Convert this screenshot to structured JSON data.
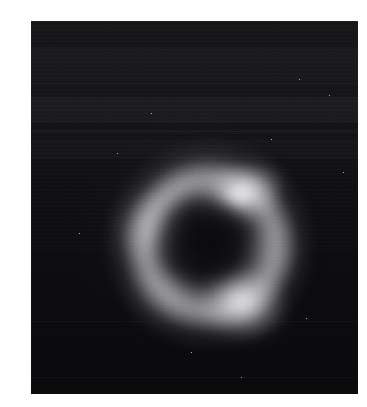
{
  "figure": {
    "kind": "astronomical-image",
    "caption": "",
    "page_background": "#ffffff"
  },
  "panel": {
    "name": "image-panel",
    "x": 31,
    "y": 21,
    "width": 327,
    "height": 373,
    "background_color": "#0d0d0d",
    "colormap": "grayscale",
    "artifacts": [
      "horizontal-scan-banding",
      "film-grain",
      "vignette"
    ]
  },
  "chart_data": {
    "type": "heatmap",
    "title": "",
    "subtitle": "",
    "xlabel": "",
    "ylabel": "",
    "colormap": "grayscale",
    "grid": false,
    "legend": "none",
    "axis_visible": false,
    "tick_labels": [],
    "image_extent": {
      "x0": 0,
      "x1": 327,
      "y0": 0,
      "y1": 373
    },
    "intensity_range": [
      0,
      255
    ],
    "background_level": 14,
    "structures": [
      {
        "name": "einstein-ring",
        "role": "lensed-arc-system",
        "center_x": 159,
        "center_y": 214,
        "outer_radius": 86,
        "ring_radius": 62,
        "peak_intensity": 215,
        "mean_intensity": 96
      },
      {
        "name": "lens-galaxy-core",
        "role": "foreground-deflector",
        "center_x": 159,
        "center_y": 214,
        "radius": 34,
        "peak_intensity": 22
      }
    ],
    "knots": [
      {
        "label": "A",
        "position": "upper-right",
        "center_x": 186,
        "center_y": 175,
        "peak_intensity": 248,
        "relative_brightness": 1.0,
        "position_angle_deg": 58
      },
      {
        "label": "B",
        "position": "lower",
        "center_x": 189,
        "center_y": 264,
        "peak_intensity": 212,
        "relative_brightness": 0.82,
        "position_angle_deg": 318
      },
      {
        "label": "C",
        "position": "left",
        "center_x": 109,
        "center_y": 204,
        "peak_intensity": 158,
        "relative_brightness": 0.6,
        "position_angle_deg": 176
      },
      {
        "label": "D",
        "position": "upper-left-bridge",
        "center_x": 120,
        "center_y": 168,
        "peak_intensity": 118,
        "relative_brightness": 0.42,
        "position_angle_deg": 132
      },
      {
        "label": "E",
        "position": "lower-left",
        "center_x": 105,
        "center_y": 250,
        "peak_intensity": 104,
        "relative_brightness": 0.36,
        "position_angle_deg": 218
      },
      {
        "label": "F",
        "position": "right",
        "center_x": 202,
        "center_y": 219,
        "peak_intensity": 98,
        "relative_brightness": 0.33,
        "position_angle_deg": 12
      }
    ],
    "banding": [
      {
        "y": 26,
        "height": 34,
        "delta_intensity": 6
      },
      {
        "y": 62,
        "height": 1,
        "delta_intensity": 14
      },
      {
        "y": 76,
        "height": 26,
        "delta_intensity": 7
      },
      {
        "y": 110,
        "height": 1,
        "delta_intensity": 15
      },
      {
        "y": 118,
        "height": 20,
        "delta_intensity": 5
      },
      {
        "y": 300,
        "height": 1,
        "delta_intensity": 8
      },
      {
        "y": 356,
        "height": 1,
        "delta_intensity": 9
      }
    ],
    "speckles": [
      {
        "x": 268,
        "y": 58
      },
      {
        "x": 298,
        "y": 74
      },
      {
        "x": 86,
        "y": 132
      },
      {
        "x": 312,
        "y": 151
      },
      {
        "x": 48,
        "y": 212
      },
      {
        "x": 275,
        "y": 297
      },
      {
        "x": 160,
        "y": 331
      },
      {
        "x": 210,
        "y": 356
      },
      {
        "x": 120,
        "y": 92
      },
      {
        "x": 240,
        "y": 118
      }
    ]
  }
}
